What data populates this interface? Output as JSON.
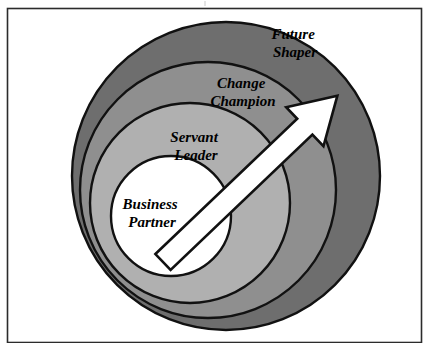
{
  "diagram": {
    "type": "concentric-spiral",
    "frame": {
      "visible": true,
      "color": "#2b2b2b",
      "x": 7,
      "y": 8,
      "width": 415,
      "height": 335
    },
    "background_color": "#ffffff",
    "outline_color": "#111111",
    "levels": [
      {
        "index": 0,
        "label": "Business Partner",
        "label_lines": [
          "Business",
          "Partner"
        ],
        "fill": "#ffffff",
        "label_x": 152,
        "label_y": 213,
        "font_size": 15,
        "line_height": 18,
        "depth": "innermost"
      },
      {
        "index": 1,
        "label": "Servant Leader",
        "label_lines": [
          "Servant",
          "Leader"
        ],
        "fill": "#b0b0b0",
        "label_x": 196,
        "label_y": 146,
        "font_size": 15,
        "line_height": 18,
        "depth": "inner"
      },
      {
        "index": 2,
        "label": "Change Champion",
        "label_lines": [
          "Change",
          "Champion"
        ],
        "fill": "#8f8f8f",
        "label_x": 243,
        "label_y": 92,
        "font_size": 15,
        "line_height": 18,
        "depth": "outer"
      },
      {
        "index": 3,
        "label": "Future Shaper",
        "label_lines": [
          "Future",
          "Shaper"
        ],
        "fill": "#6e6e6e",
        "label_x": 295,
        "label_y": 43,
        "font_size": 15,
        "line_height": 18,
        "depth": "outermost"
      }
    ],
    "arrow": {
      "name": "growth-arrow",
      "direction": "up-right",
      "fill": "#ffffff",
      "stroke": "#111111",
      "tail_x": 163,
      "tail_y": 262,
      "tip_x": 337,
      "tip_y": 96
    }
  }
}
